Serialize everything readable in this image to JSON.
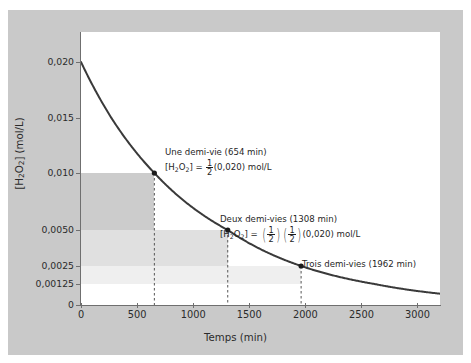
{
  "chart_data": {
    "type": "line",
    "title": "",
    "xlabel": "Temps (min)",
    "ylabel": "[H2O2] (mol/L)",
    "xlim": [
      0,
      3200
    ],
    "ylim": [
      0,
      0.02
    ],
    "grid": false,
    "legend_position": "none",
    "xticks": [
      0,
      500,
      1000,
      1500,
      2000,
      2500,
      3000
    ],
    "xtick_labels": [
      "0",
      "500",
      "1000",
      "1500",
      "2000",
      "2500",
      "3000"
    ],
    "yticks": [
      0,
      0.00125,
      0.0025,
      0.005,
      0.01,
      0.015,
      0.02
    ],
    "ytick_labels": [
      "0",
      "0,00125",
      "0,0025",
      "0,0050",
      "0,010",
      "0,015",
      "0,020"
    ],
    "series": [
      {
        "name": "[H2O2] decay",
        "model": "exponential first-order decay",
        "initial_value": 0.02,
        "half_life_min": 654,
        "x": [
          0,
          100,
          200,
          300,
          400,
          500,
          654,
          800,
          1000,
          1200,
          1308,
          1500,
          1800,
          1962,
          2200,
          2500,
          2800,
          3000,
          3200
        ],
        "y": [
          0.02,
          0.018,
          0.0162,
          0.0146,
          0.0131,
          0.0118,
          0.01,
          0.0086,
          0.0069,
          0.0055,
          0.005,
          0.004,
          0.0029,
          0.0025,
          0.0019,
          0.0013,
          0.00092,
          0.00073,
          0.00058
        ]
      }
    ],
    "markers": [
      {
        "label": "half-life-1",
        "x": 654,
        "y": 0.01
      },
      {
        "label": "half-life-2",
        "x": 1308,
        "y": 0.005
      },
      {
        "label": "half-life-3",
        "x": 1962,
        "y": 0.0025
      }
    ],
    "dashed_verticals": [
      654,
      1308,
      1962
    ],
    "shaded_regions": [
      {
        "name": "region-1",
        "x0": 0,
        "x1": 654,
        "y0": 0.005,
        "y1": 0.01,
        "color": "#cccccc"
      },
      {
        "name": "region-2",
        "x0": 0,
        "x1": 1308,
        "y0": 0.0025,
        "y1": 0.005,
        "color": "#e0e0e0"
      },
      {
        "name": "region-3",
        "x0": 0,
        "x1": 1962,
        "y0": 0.00125,
        "y1": 0.0025,
        "color": "#efefef"
      }
    ],
    "annotations": [
      {
        "name": "annotation-one-half-life",
        "line1": "Une demi-vie (654 min)",
        "line2_prefix": "[H",
        "line2_sub1": "2",
        "line2_mid": "O",
        "line2_sub2": "2",
        "line2_eq": "] =",
        "fraction_num": "1",
        "fraction_den": "2",
        "line2_suffix": "(0,020) mol/L"
      },
      {
        "name": "annotation-two-half-lives",
        "line1": "Deux demi-vies (1308 min)",
        "line2_prefix": "[H",
        "line2_sub1": "2",
        "line2_mid": "O",
        "line2_sub2": "2",
        "line2_eq": "] =",
        "fraction_num": "1",
        "fraction_den": "2",
        "line2_suffix": "(0,020) mol/L"
      },
      {
        "name": "annotation-three-half-lives",
        "line1": "Trois demi-vies (1962 min)"
      }
    ],
    "colors": {
      "curve": "#3a3a3a",
      "axis": "#6f6f6f",
      "text": "#2b2b2b",
      "backdrop": "#c9c9c9",
      "plot_background": "#ffffff"
    }
  },
  "axes": {
    "y_title_prefix": "[H",
    "y_title_sub1": "2",
    "y_title_mid": "O",
    "y_title_sub2": "2",
    "y_title_suffix": "] (mol/L)",
    "x_title": "Temps (min)"
  }
}
